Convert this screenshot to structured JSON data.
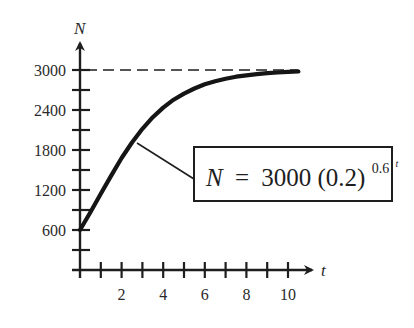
{
  "chart_data": {
    "type": "line",
    "title": "",
    "xlabel": "t",
    "ylabel": "N",
    "xlim": [
      0,
      10.5
    ],
    "ylim": [
      0,
      3200
    ],
    "x_ticks": [
      1,
      2,
      3,
      4,
      5,
      6,
      7,
      8,
      9,
      10
    ],
    "x_tick_labels": [
      "2",
      "4",
      "6",
      "8",
      "10"
    ],
    "x_tick_label_values": [
      2,
      4,
      6,
      8,
      10
    ],
    "y_ticks": [
      300,
      600,
      900,
      1200,
      1500,
      1800,
      2100,
      2400,
      2700,
      3000
    ],
    "y_tick_labels": [
      "600",
      "1200",
      "1800",
      "2400",
      "3000"
    ],
    "y_tick_label_values": [
      600,
      1200,
      1800,
      2400,
      3000
    ],
    "grid": false,
    "series": [
      {
        "name": "N = 3000(0.2)^(0.6^t)",
        "style": "solid-thick",
        "x": [
          0,
          0.5,
          1,
          1.5,
          2,
          2.5,
          3,
          3.5,
          4,
          4.5,
          5,
          5.5,
          6,
          6.5,
          7,
          7.5,
          8,
          8.5,
          9,
          9.5,
          10,
          10.5
        ],
        "values": [
          600,
          866,
          1144,
          1416,
          1680,
          1912,
          2118,
          2292,
          2436,
          2554,
          2646,
          2723,
          2785,
          2832,
          2869,
          2899,
          2920,
          2938,
          2952,
          2963,
          2971,
          2977
        ]
      },
      {
        "name": "asymptote N = 3000",
        "style": "dashed",
        "x": [
          0,
          10.5
        ],
        "values": [
          3000,
          3000
        ]
      }
    ],
    "annotations": [
      {
        "text": "N = 3000(0.2)^(0.6^t)",
        "boxed": true,
        "points_to": {
          "x": 2.75,
          "y": 1900
        }
      }
    ],
    "legend": null
  },
  "labels": {
    "y_axis": "N",
    "x_axis": "t",
    "formula_lhs": "N",
    "formula_eq": "=",
    "formula_coef": "3000",
    "formula_base": "(0.2)",
    "formula_exp_base": "0.6",
    "formula_exp_exp": "t"
  }
}
